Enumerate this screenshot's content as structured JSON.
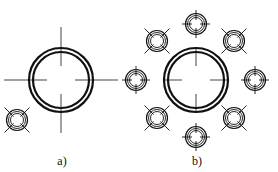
{
  "figure": {
    "stroke_color": "#111111",
    "panels": [
      {
        "id": "a",
        "label": "a)",
        "label_pos": [
          62,
          155
        ],
        "main_circle": {
          "cx": 61,
          "cy": 80,
          "r_outer": 32,
          "r_inner": 28
        },
        "crosshair": {
          "extend_out": 25,
          "extend_in": 16
        },
        "small_elements": [
          {
            "cx": 17,
            "cy": 120,
            "type": "x-cross"
          }
        ]
      },
      {
        "id": "b",
        "label": "b)",
        "label_pos": [
          197,
          155
        ],
        "main_circle": {
          "cx": 196,
          "cy": 80,
          "r_outer": 32,
          "r_inner": 28
        },
        "crosshair": {
          "extend_out": 0,
          "extend_in": 16
        },
        "small_elements": [
          {
            "cx": 196,
            "cy": 24,
            "type": "plus-cross"
          },
          {
            "cx": 234,
            "cy": 41,
            "type": "x-cross"
          },
          {
            "cx": 255,
            "cy": 80,
            "type": "plus-cross"
          },
          {
            "cx": 234,
            "cy": 118,
            "type": "x-cross"
          },
          {
            "cx": 196,
            "cy": 137,
            "type": "plus-cross"
          },
          {
            "cx": 157,
            "cy": 118,
            "type": "x-cross"
          },
          {
            "cx": 136,
            "cy": 80,
            "type": "plus-cross"
          },
          {
            "cx": 157,
            "cy": 41,
            "type": "x-cross"
          }
        ]
      }
    ]
  }
}
